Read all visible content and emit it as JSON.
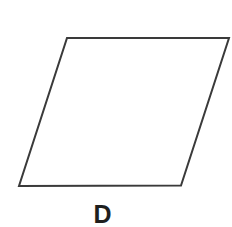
{
  "diagram": {
    "shape": "parallelogram",
    "vertices": [
      [
        67,
        38
      ],
      [
        229,
        38
      ],
      [
        181,
        185.5
      ],
      [
        19,
        186
      ]
    ],
    "stroke_color": "#3a3a3a",
    "stroke_width": 2,
    "fill_color": "#ffffff",
    "label": "D"
  }
}
